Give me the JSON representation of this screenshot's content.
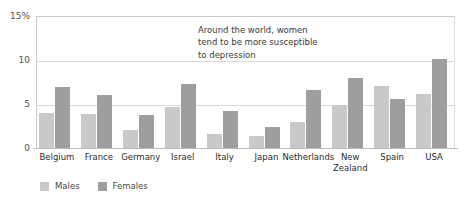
{
  "chart_data": {
    "type": "bar",
    "title": "",
    "xlabel": "",
    "ylabel": "",
    "ylim": [
      0,
      15
    ],
    "yticks": [
      "15%",
      "10",
      "5",
      "0"
    ],
    "ytick_values": [
      15,
      10,
      5,
      0
    ],
    "grid": true,
    "legend_position": "bottom-left",
    "categories": [
      "Belgium",
      "France",
      "Germany",
      "Israel",
      "Italy",
      "Japan",
      "Netherlands",
      "New\nZealand",
      "Spain",
      "USA"
    ],
    "series": [
      {
        "name": "Males",
        "color": "#c9c9c9",
        "values": [
          4.0,
          3.9,
          2.1,
          4.7,
          1.6,
          1.4,
          2.9,
          4.9,
          7.1,
          6.1
        ]
      },
      {
        "name": "Females",
        "color": "#9e9e9e",
        "values": [
          6.9,
          6.0,
          3.7,
          7.3,
          4.2,
          2.4,
          6.6,
          8.0,
          5.6,
          10.1
        ]
      }
    ],
    "annotations": [
      {
        "text": "Around the world, women\ntend to be more susceptible\nto depression"
      }
    ]
  }
}
